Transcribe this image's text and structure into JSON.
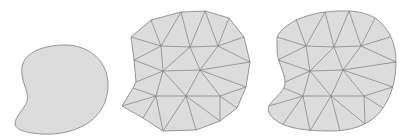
{
  "figure": {
    "panels": [
      {
        "id": "domain",
        "label": "smooth domain"
      },
      {
        "id": "initial-mesh",
        "label": "initial triangulation"
      },
      {
        "id": "fitted-mesh",
        "label": "boundary-fitted triangulation"
      }
    ],
    "colors": {
      "background": "#ffffff",
      "fill": "#dcdcdc",
      "edge": "#7d7d7d",
      "outline": "#8a8a8a"
    }
  }
}
